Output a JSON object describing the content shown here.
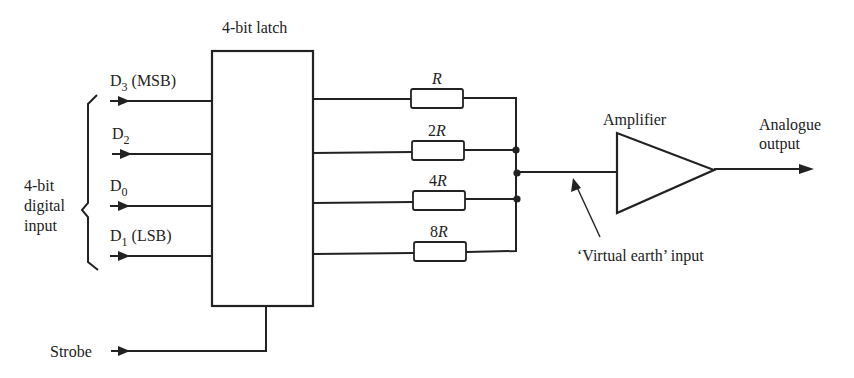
{
  "diagram": {
    "type": "4-bit weighted-resistor digital-to-analogue converter",
    "latch_label": "4-bit latch",
    "input_group_label_lines": [
      "4-bit",
      "digital",
      "input"
    ],
    "inputs": [
      {
        "name": "D",
        "sub": "3",
        "suffix": " (MSB)",
        "resistor": "R"
      },
      {
        "name": "D",
        "sub": "2",
        "suffix": "",
        "resistor": "2R"
      },
      {
        "name": "D",
        "sub": "0",
        "suffix": "",
        "resistor": "4R"
      },
      {
        "name": "D",
        "sub": "1",
        "suffix": " (LSB)",
        "resistor": "8R"
      }
    ],
    "resistors": [
      {
        "num": "",
        "var": "R"
      },
      {
        "num": "2",
        "var": "R"
      },
      {
        "num": "4",
        "var": "R"
      },
      {
        "num": "8",
        "var": "R"
      }
    ],
    "strobe_label": "Strobe",
    "amplifier_label": "Amplifier",
    "virtual_earth_label": "‘Virtual earth’ input",
    "output_label_lines": [
      "Analogue",
      "output"
    ],
    "colors": {
      "ink": "#222222",
      "background": "#ffffff"
    }
  }
}
